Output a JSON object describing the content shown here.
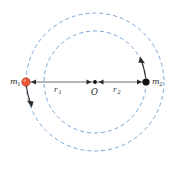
{
  "figure": {
    "background_color": "#ffffff",
    "center": {
      "x": 95,
      "y": 82
    },
    "orbit_color": "#7aa6d8",
    "axis_color": "#5a5a5a"
  },
  "labels": {
    "mass1": {
      "base": "m",
      "sub": "1"
    },
    "mass2": {
      "base": "m",
      "sub": "2"
    },
    "radius1": {
      "base": "r",
      "sub": "1"
    },
    "radius2": {
      "base": "r",
      "sub": "2"
    },
    "center": "O"
  },
  "bodies": [
    {
      "name": "mass-1",
      "label": "m1",
      "color": "#e8563a",
      "x": 26,
      "y": 82,
      "radius": 4.2
    },
    {
      "name": "mass-2",
      "label": "m2",
      "color": "#111111",
      "x": 146,
      "y": 82,
      "radius": 3.6
    }
  ],
  "orbits": [
    {
      "name": "orbit-mass-1",
      "radius": 69,
      "dash": "4 3"
    },
    {
      "name": "orbit-mass-2",
      "radius": 51,
      "dash": "4 3"
    }
  ],
  "velocity_arrows": [
    {
      "name": "velocity-arrow-mass-1",
      "direction": "down"
    },
    {
      "name": "velocity-arrow-mass-2",
      "direction": "up"
    }
  ],
  "segments": [
    {
      "name": "radius-segment-1",
      "from_x": 26,
      "to_x": 95,
      "label": "r1"
    },
    {
      "name": "radius-segment-2",
      "from_x": 95,
      "to_x": 146,
      "label": "r2"
    }
  ]
}
